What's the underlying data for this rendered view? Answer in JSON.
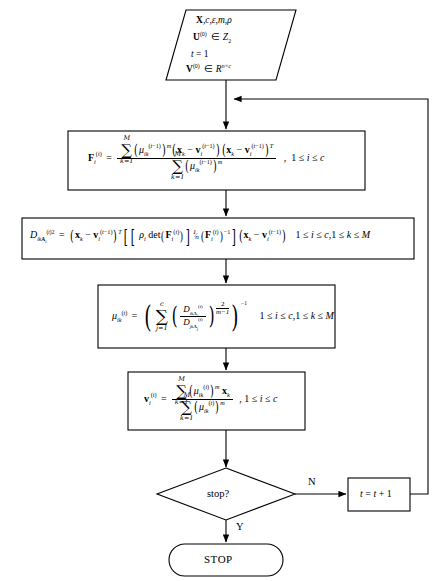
{
  "diagram": {
    "type": "flowchart",
    "nodes": [
      {
        "id": "input",
        "shape": "parallelogram",
        "name": "input-node",
        "lines": [
          "X, c, ε, m, ρ",
          "U(0) ∈ Z2",
          "t = 1",
          "V(0) ∈ R^{n×c}"
        ]
      },
      {
        "id": "covariance",
        "shape": "rectangle",
        "name": "fuzzy-covariance-box",
        "formula": "F_i^{(t)} = [ ∑_{k=1}^{M} (μ_ik^{(t-1)})^m (x_k − v_i^{(t-1)})(x_k − v_i^{(t-1)})^T ] / [ ∑_{k=1}^{M} (μ_ik^{(t-1)})^m ] ,  1 ≤ i ≤ c",
        "condition": "1 ≤ i ≤ c"
      },
      {
        "id": "distance",
        "shape": "rectangle",
        "name": "distance-box",
        "formula": "D_{ikA_i}^{(t)2} = (x_k − v_i^{(t-1)})^T [ [ ρ_i det(F_i^{(t)}) ]^{1/n} (F_i^{(t)})^{-1} ] (x_k − v_i^{(t-1)})",
        "condition": "1 ≤ i ≤ c, 1 ≤ k ≤ M"
      },
      {
        "id": "membership",
        "shape": "rectangle",
        "name": "membership-update-box",
        "formula": "μ_ik^{(t)} = ( ∑_{j=1}^{c} ( D_{ikA_i}^{(t)} / D_{jkA_j}^{(t)} )^{2/(m-1)} )^{-1}",
        "condition": "1 ≤ i ≤ c, 1 ≤ k ≤ M"
      },
      {
        "id": "centers",
        "shape": "rectangle",
        "name": "cluster-center-update-box",
        "formula": "v_i^{(t)} = [ ∑_{k=1}^{M} (μ_ik^{(t)})^m x_k ] / [ ∑_{k=1}^{M} (μ_ik^{(t)})^m ] ,  1 ≤ i ≤ c",
        "condition": "1 ≤ i ≤ c"
      },
      {
        "id": "decision",
        "shape": "diamond",
        "name": "stop-decision",
        "label": "stop?"
      },
      {
        "id": "increment",
        "shape": "rectangle",
        "name": "increment-box",
        "label": "t = t + 1"
      },
      {
        "id": "stop",
        "shape": "terminator",
        "name": "stop-terminator",
        "label": "STOP"
      }
    ],
    "edge_labels": {
      "no": "N",
      "yes": "Y"
    },
    "colors": {
      "stroke": "#000000",
      "background": "#ffffff",
      "text": "#000000"
    }
  }
}
